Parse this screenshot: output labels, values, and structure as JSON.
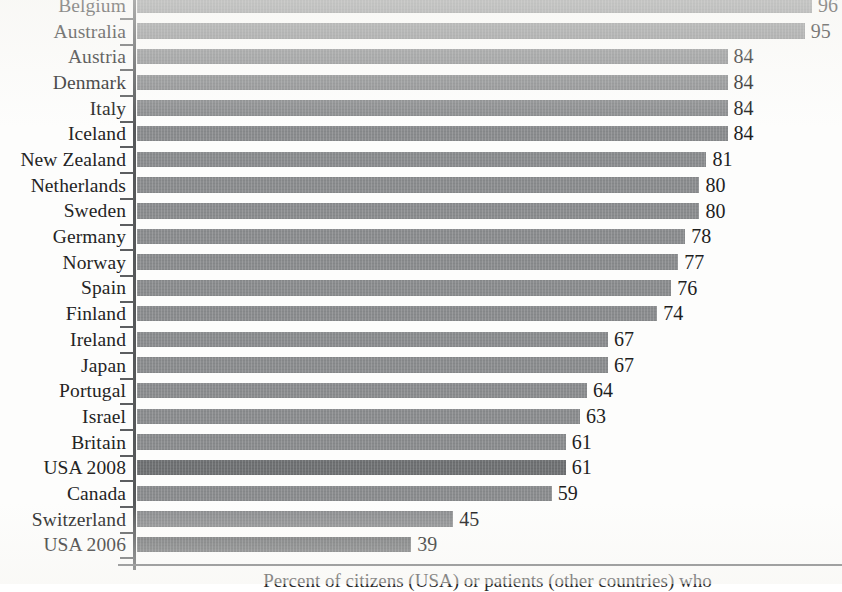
{
  "chart_data": {
    "type": "bar",
    "orientation": "horizontal",
    "title": "",
    "xlabel": "Percent of citizens (USA) or patients (other countries) who",
    "ylabel": "",
    "xlim": [
      0,
      100
    ],
    "grid": false,
    "legend": "none",
    "value_suffix": "",
    "categories": [
      "Belgium",
      "Australia",
      "Austria",
      "Denmark",
      "Italy",
      "Iceland",
      "New Zealand",
      "Netherlands",
      "Sweden",
      "Germany",
      "Norway",
      "Spain",
      "Finland",
      "Ireland",
      "Japan",
      "Portugal",
      "Israel",
      "Britain",
      "USA 2008",
      "Canada",
      "Switzerland",
      "USA 2006"
    ],
    "values": [
      96,
      95,
      84,
      84,
      84,
      84,
      81,
      80,
      80,
      78,
      77,
      76,
      74,
      67,
      67,
      64,
      63,
      61,
      61,
      59,
      45,
      39
    ],
    "highlighted": [
      "USA 2008",
      "USA 2006"
    ],
    "bar_color": "#8a8c8e",
    "highlight_color": "#6f7173",
    "axis_color": "#56585a",
    "text_color": "#242424"
  }
}
